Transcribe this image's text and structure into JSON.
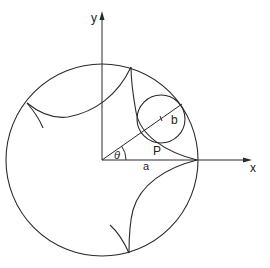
{
  "diagram": {
    "labels": {
      "y_axis": "y",
      "x_axis": "x",
      "angle": "θ",
      "big_radius": "a",
      "small_radius": "b",
      "point": "P"
    },
    "colors": {
      "line": "#2a2a2a",
      "background": "#ffffff"
    },
    "geometry": {
      "origin": [
        102,
        160
      ],
      "big_circle_radius": 96,
      "small_circle_center": [
        161,
        119
      ],
      "small_circle_radius": 24,
      "theta_deg": 35,
      "cusps": [
        [
          197,
          160
        ],
        [
          131,
          67
        ],
        [
          27,
          103
        ],
        [
          129,
          253
        ]
      ]
    }
  }
}
